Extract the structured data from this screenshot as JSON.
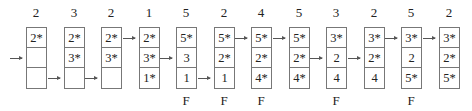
{
  "steps": [
    {
      "ref": "2",
      "frames": [
        "2*",
        "",
        ""
      ],
      "pointer": 1,
      "fault": ""
    },
    {
      "ref": "3",
      "frames": [
        "2*",
        "3*",
        ""
      ],
      "pointer": 2,
      "fault": ""
    },
    {
      "ref": "2",
      "frames": [
        "2*",
        "3*",
        ""
      ],
      "pointer": 2,
      "fault": ""
    },
    {
      "ref": "1",
      "frames": [
        "2*",
        "3*",
        "1*"
      ],
      "pointer": 0,
      "fault": ""
    },
    {
      "ref": "5",
      "frames": [
        "5*",
        "3",
        "1"
      ],
      "pointer": 1,
      "fault": "F"
    },
    {
      "ref": "2",
      "frames": [
        "5*",
        "2*",
        "1"
      ],
      "pointer": 2,
      "fault": "F"
    },
    {
      "ref": "4",
      "frames": [
        "5*",
        "2*",
        "4*"
      ],
      "pointer": 0,
      "fault": "F"
    },
    {
      "ref": "5",
      "frames": [
        "5*",
        "2*",
        "4*"
      ],
      "pointer": 0,
      "fault": ""
    },
    {
      "ref": "3",
      "frames": [
        "3*",
        "2",
        "4"
      ],
      "pointer": 1,
      "fault": "F"
    },
    {
      "ref": "2",
      "frames": [
        "3*",
        "2*",
        "4"
      ],
      "pointer": 1,
      "fault": ""
    },
    {
      "ref": "5",
      "frames": [
        "3*",
        "2",
        "5*"
      ],
      "pointer": 0,
      "fault": "F"
    },
    {
      "ref": "2",
      "frames": [
        "3*",
        "2*",
        "5*"
      ],
      "pointer": 0,
      "fault": ""
    }
  ]
}
